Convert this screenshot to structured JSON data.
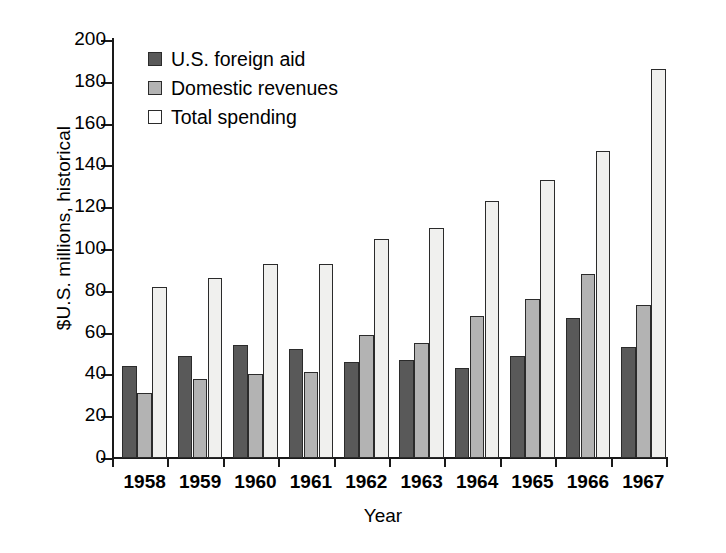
{
  "chart_data": {
    "type": "bar",
    "title": "",
    "subtitle": "",
    "xlabel": "Year",
    "ylabel": "$U.S. millions, historical",
    "categories": [
      "1958",
      "1959",
      "1960",
      "1961",
      "1962",
      "1963",
      "1964",
      "1965",
      "1966",
      "1967"
    ],
    "series": [
      {
        "name": "U.S. foreign aid",
        "color": "#595959",
        "values": [
          44,
          49,
          54,
          52,
          46,
          47,
          43,
          49,
          67,
          53
        ]
      },
      {
        "name": "Domestic revenues",
        "color": "#b3b3b3",
        "values": [
          31,
          38,
          40,
          41,
          59,
          55,
          68,
          76,
          88,
          73
        ]
      },
      {
        "name": "Total spending",
        "color": "#f0f0ee",
        "values": [
          82,
          86,
          93,
          93,
          105,
          110,
          123,
          133,
          147,
          186
        ]
      }
    ],
    "ylim": [
      0,
      200
    ],
    "ytick_labels": [
      "0",
      "20",
      "40",
      "60",
      "80",
      "100",
      "120",
      "140",
      "160",
      "180",
      "200"
    ],
    "ytick_values": [
      0,
      20,
      40,
      60,
      80,
      100,
      120,
      140,
      160,
      180,
      200
    ],
    "grid": false,
    "legend_position": "top-left",
    "legend_entries": [
      "U.S. foreign aid",
      "Domestic revenues",
      "Total spending"
    ]
  }
}
